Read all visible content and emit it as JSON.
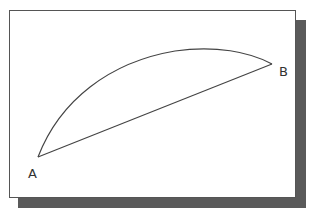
{
  "diagram": {
    "type": "geometry-arc-and-chord",
    "frame": {
      "border_color": "#555555",
      "shadow_color": "#5a5a5a",
      "background": "#ffffff"
    },
    "points": [
      {
        "label": "A",
        "x": 38,
        "y": 157
      },
      {
        "label": "B",
        "x": 272,
        "y": 64
      }
    ],
    "edges": [
      {
        "from": "A",
        "to": "B",
        "kind": "straight-line",
        "name": "chord"
      },
      {
        "from": "A",
        "to": "B",
        "kind": "curved-arc",
        "name": "arc",
        "apex": {
          "x": 200,
          "y": 49
        }
      }
    ],
    "labels": {
      "a": "A",
      "b": "B"
    },
    "stroke_color": "#444444"
  }
}
